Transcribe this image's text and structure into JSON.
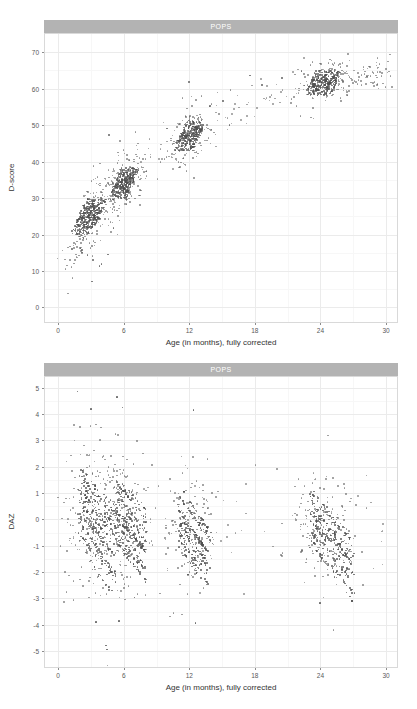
{
  "figure": {
    "panel_label": "POPS",
    "background_color": "#ffffff",
    "strip_color": "#b3b3b3",
    "point_color": "#4d4d4d",
    "grid_color": "#ebebeb"
  },
  "chart_data": [
    {
      "type": "scatter",
      "id": "dscore-vs-age",
      "title": "POPS",
      "xlabel": "Age (in months), fully corrected",
      "ylabel": "D-score",
      "xlim": [
        -1.2,
        31.0
      ],
      "ylim": [
        -4.0,
        75.0
      ],
      "xticks": [
        0,
        6,
        12,
        18,
        24,
        30
      ],
      "yticks": [
        0,
        10,
        20,
        30,
        40,
        50,
        60,
        70
      ],
      "grid": true,
      "legend": "none",
      "description": "D-score rises steeply from about 10 at 1 month to about 65 at 24-30 months; points cluster at measurement visits near 2-4, 6, 12 and 24 months and form horizontal streaks at discrete D-score levels.",
      "clusters": [
        {
          "age_center": 2.8,
          "age_spread": 1.3,
          "score_center": 25.5,
          "score_spread": 4.8,
          "n": 330,
          "streak": "horizontal"
        },
        {
          "age_center": 6.0,
          "age_spread": 1.1,
          "score_center": 34.5,
          "score_spread": 4.2,
          "n": 300,
          "streak": "horizontal"
        },
        {
          "age_center": 12.0,
          "age_spread": 1.2,
          "score_center": 47.5,
          "score_spread": 4.0,
          "n": 270,
          "streak": "horizontal"
        },
        {
          "age_center": 24.2,
          "age_spread": 1.6,
          "score_center": 62.0,
          "score_spread": 3.2,
          "n": 300,
          "streak": "horizontal"
        }
      ],
      "trend_points": [
        {
          "x": 1.0,
          "y": 13.0
        },
        {
          "x": 2.0,
          "y": 20.0
        },
        {
          "x": 3.0,
          "y": 25.5
        },
        {
          "x": 4.5,
          "y": 30.5
        },
        {
          "x": 6.0,
          "y": 34.5
        },
        {
          "x": 9.0,
          "y": 41.5
        },
        {
          "x": 12.0,
          "y": 47.5
        },
        {
          "x": 15.0,
          "y": 52.0
        },
        {
          "x": 18.0,
          "y": 56.0
        },
        {
          "x": 21.0,
          "y": 59.5
        },
        {
          "x": 24.0,
          "y": 62.0
        },
        {
          "x": 27.0,
          "y": 63.5
        },
        {
          "x": 30.0,
          "y": 64.5
        }
      ]
    },
    {
      "type": "scatter",
      "id": "daz-vs-age",
      "title": "POPS",
      "xlabel": "Age (in months), fully corrected",
      "ylabel": "DAZ",
      "xlim": [
        -1.2,
        31.0
      ],
      "ylim": [
        -5.6,
        5.4
      ],
      "xticks": [
        0,
        6,
        12,
        18,
        24,
        30
      ],
      "yticks": [
        -5,
        -4,
        -3,
        -2,
        -1,
        0,
        1,
        2,
        3,
        4,
        5
      ],
      "grid": true,
      "legend": "none",
      "description": "DAZ is centred near 0 at all ages with spread roughly -3 to +3; within each visit cluster points fall along downward-sloping diagonal streaks, and a few outliers reach +4.9 and -5.0.",
      "clusters": [
        {
          "age_center": 3.0,
          "age_spread": 1.4,
          "z_center": 0.0,
          "z_spread": 1.35,
          "n": 340,
          "streak": "diagonal-down"
        },
        {
          "age_center": 6.2,
          "age_spread": 1.2,
          "z_center": -0.25,
          "z_spread": 1.25,
          "n": 310,
          "streak": "diagonal-down"
        },
        {
          "age_center": 12.0,
          "age_spread": 1.2,
          "z_center": -0.55,
          "z_spread": 1.15,
          "n": 260,
          "streak": "diagonal-down"
        },
        {
          "age_center": 24.3,
          "age_spread": 1.7,
          "z_center": -0.45,
          "z_spread": 1.05,
          "n": 300,
          "streak": "diagonal-down"
        }
      ],
      "outliers": [
        {
          "x": 1.7,
          "y": 4.88
        },
        {
          "x": 5.3,
          "y": 4.67
        },
        {
          "x": 5.8,
          "y": 4.27
        },
        {
          "x": 12.3,
          "y": 4.19
        },
        {
          "x": 2.9,
          "y": 4.21
        },
        {
          "x": 4.4,
          "y": -4.9
        },
        {
          "x": 4.3,
          "y": -4.75
        },
        {
          "x": 5.5,
          "y": -3.82
        },
        {
          "x": 3.4,
          "y": -3.85
        },
        {
          "x": 12.5,
          "y": -3.9
        },
        {
          "x": 23.9,
          "y": -3.15
        }
      ]
    }
  ]
}
